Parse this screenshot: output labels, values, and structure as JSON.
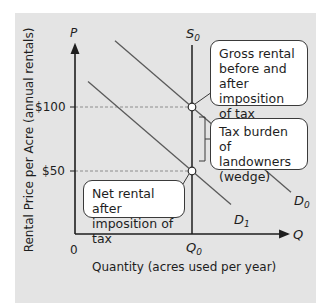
{
  "chart_data": {
    "type": "line",
    "title": "",
    "xlabel": "Quantity (acres used per year)",
    "ylabel": "Rental Price per Acre (annual rentals)",
    "x_axis_symbol": "Q",
    "y_axis_symbol": "P",
    "origin_label": "0",
    "y_ticks": [
      {
        "value": 100,
        "label": "$100"
      },
      {
        "value": 50,
        "label": "$50"
      }
    ],
    "x_ticks": [
      {
        "label": "Q",
        "subscript": "0"
      }
    ],
    "series": [
      {
        "name": "S0",
        "label": "S",
        "subscript": "0",
        "kind": "supply",
        "shape": "vertical",
        "at_x": "Q0"
      },
      {
        "name": "D0",
        "label": "D",
        "subscript": "0",
        "kind": "demand",
        "shape": "downward-sloping",
        "value_at_Q0": 100
      },
      {
        "name": "D1",
        "label": "D",
        "subscript": "1",
        "kind": "demand",
        "shape": "downward-sloping",
        "value_at_Q0": 50
      }
    ],
    "points": [
      {
        "name": "gross-rental-point",
        "x": "Q0",
        "y": 100
      },
      {
        "name": "net-rental-point",
        "x": "Q0",
        "y": 50
      }
    ],
    "guides": [
      {
        "y": 100,
        "style": "dashed"
      },
      {
        "y": 50,
        "style": "dashed"
      }
    ],
    "annotations": [
      {
        "name": "gross-rental",
        "text": [
          "Gross rental",
          "before and",
          "after imposition",
          "of tax"
        ]
      },
      {
        "name": "tax-burden",
        "text": [
          "Tax burden",
          "of landowners",
          "(wedge)"
        ]
      },
      {
        "name": "net-rental",
        "text": [
          "Net rental after",
          "imposition of tax"
        ]
      }
    ],
    "grid": false
  },
  "colors": {
    "panel": "#e4e4e4",
    "axis": "#1e1e1e",
    "curve": "#5a5a5a",
    "callout_bg": "#ffffff"
  }
}
